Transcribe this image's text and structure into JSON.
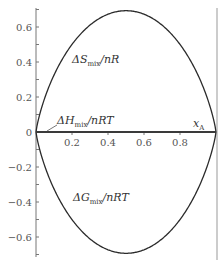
{
  "chart_data": {
    "type": "line",
    "title": "",
    "xlabel": "x_A",
    "ylabel": "",
    "xlim": [
      0,
      1
    ],
    "ylim": [
      -0.7,
      0.7
    ],
    "grid": false,
    "x_ticks": [
      0.2,
      0.4,
      0.6,
      0.8
    ],
    "x_tick_labels": [
      "0.2",
      "0.4",
      "0.6",
      "0.8"
    ],
    "y_ticks": [
      0.6,
      0.4,
      0.2,
      0,
      -0.2,
      -0.4,
      -0.6
    ],
    "y_tick_labels": [
      "0.6",
      "0.4",
      "0.2",
      "0",
      "−0.2",
      "−0.4",
      "−0.6"
    ],
    "series": [
      {
        "name": "ΔS_mix/nR",
        "formula": "-(x ln x + (1-x) ln(1-x))",
        "x": [
          0,
          0.05,
          0.1,
          0.2,
          0.3,
          0.4,
          0.5,
          0.6,
          0.7,
          0.8,
          0.9,
          0.95,
          1
        ],
        "values": [
          0,
          0.199,
          0.325,
          0.5,
          0.611,
          0.673,
          0.693,
          0.673,
          0.611,
          0.5,
          0.325,
          0.199,
          0
        ]
      },
      {
        "name": "ΔH_mix/nRT",
        "x": [
          0,
          1
        ],
        "values": [
          0,
          0
        ]
      },
      {
        "name": "ΔG_mix/nRT",
        "formula": "x ln x + (1-x) ln(1-x)",
        "x": [
          0,
          0.05,
          0.1,
          0.2,
          0.3,
          0.4,
          0.5,
          0.6,
          0.7,
          0.8,
          0.9,
          0.95,
          1
        ],
        "values": [
          0,
          -0.199,
          -0.325,
          -0.5,
          -0.611,
          -0.673,
          -0.693,
          -0.673,
          -0.611,
          -0.5,
          -0.325,
          -0.199,
          0
        ]
      }
    ],
    "annotations": [
      {
        "text": "ΔS_mix/nR",
        "main": "ΔS",
        "sub": "mix",
        "tail": "/nR"
      },
      {
        "text": "ΔH_mix/nRT",
        "main": "ΔH",
        "sub": "mix",
        "tail": "/nRT"
      },
      {
        "text": "ΔG_mix/nRT",
        "main": "ΔG",
        "sub": "mix",
        "tail": "/nRT"
      },
      {
        "text": "x_A",
        "main": "x",
        "sub": "A",
        "tail": ""
      }
    ]
  },
  "colors": {
    "curve": "#2b2b2b",
    "axis": "#777777",
    "text": "#444444"
  }
}
